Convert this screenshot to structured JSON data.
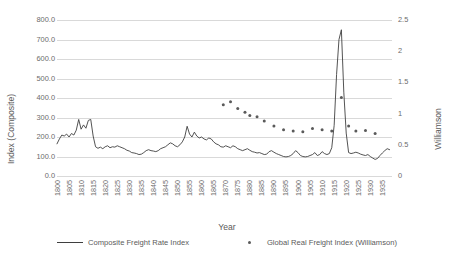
{
  "chart_data": {
    "type": "line",
    "title": "",
    "xlabel": "Year",
    "ylabel": "Index (Composite)",
    "y2label": "Williamson",
    "xlim": [
      1800,
      1939
    ],
    "ylim": [
      0,
      800
    ],
    "y2lim": [
      0,
      2.5
    ],
    "grid": true,
    "legend_position": "bottom",
    "y_ticks": [
      "0.0",
      "100.0",
      "200.0",
      "300.0",
      "400.0",
      "500.0",
      "600.0",
      "700.0",
      "800.0"
    ],
    "y_tick_values": [
      0,
      100,
      200,
      300,
      400,
      500,
      600,
      700,
      800
    ],
    "y2_ticks": [
      "0",
      "0.5",
      "1",
      "1.5",
      "2",
      "2.5"
    ],
    "y2_tick_values": [
      0,
      0.5,
      1,
      1.5,
      2,
      2.5
    ],
    "x_ticks": [
      "1800",
      "1805",
      "1810",
      "1815",
      "1820",
      "1825",
      "1830",
      "1835",
      "1840",
      "1845",
      "1850",
      "1855",
      "1860",
      "1865",
      "1870",
      "1875",
      "1880",
      "1885",
      "1890",
      "1895",
      "1900",
      "1905",
      "1910",
      "1915",
      "1920",
      "1925",
      "1930",
      "1935"
    ],
    "x_tick_values": [
      1800,
      1805,
      1810,
      1815,
      1820,
      1825,
      1830,
      1835,
      1840,
      1845,
      1850,
      1855,
      1860,
      1865,
      1870,
      1875,
      1880,
      1885,
      1890,
      1895,
      1900,
      1905,
      1910,
      1915,
      1920,
      1925,
      1930,
      1935
    ],
    "series": [
      {
        "name": "Composite Freight Rate Index",
        "type": "line",
        "axis": "left",
        "color": "#3f3f3f",
        "x": [
          1800,
          1801,
          1802,
          1803,
          1804,
          1805,
          1806,
          1807,
          1808,
          1809,
          1810,
          1811,
          1812,
          1813,
          1814,
          1815,
          1816,
          1817,
          1818,
          1819,
          1820,
          1821,
          1822,
          1823,
          1824,
          1825,
          1826,
          1827,
          1828,
          1829,
          1830,
          1831,
          1832,
          1833,
          1834,
          1835,
          1836,
          1837,
          1838,
          1839,
          1840,
          1841,
          1842,
          1843,
          1844,
          1845,
          1846,
          1847,
          1848,
          1849,
          1850,
          1851,
          1852,
          1853,
          1854,
          1855,
          1856,
          1857,
          1858,
          1859,
          1860,
          1861,
          1862,
          1863,
          1864,
          1865,
          1866,
          1867,
          1868,
          1869,
          1870,
          1871,
          1872,
          1873,
          1874,
          1875,
          1876,
          1877,
          1878,
          1879,
          1880,
          1881,
          1882,
          1883,
          1884,
          1885,
          1886,
          1887,
          1888,
          1889,
          1890,
          1891,
          1892,
          1893,
          1894,
          1895,
          1896,
          1897,
          1898,
          1899,
          1900,
          1901,
          1902,
          1903,
          1904,
          1905,
          1906,
          1907,
          1908,
          1909,
          1910,
          1911,
          1912,
          1913,
          1914,
          1915,
          1916,
          1917,
          1918,
          1919,
          1920,
          1921,
          1922,
          1923,
          1924,
          1925,
          1926,
          1927,
          1928,
          1929,
          1930,
          1931,
          1932,
          1933,
          1934,
          1935,
          1936,
          1937,
          1938
        ],
        "y": [
          165,
          190,
          210,
          205,
          215,
          200,
          218,
          210,
          235,
          290,
          240,
          262,
          245,
          285,
          290,
          205,
          150,
          142,
          148,
          140,
          150,
          155,
          145,
          150,
          148,
          155,
          150,
          145,
          140,
          132,
          128,
          120,
          118,
          115,
          110,
          112,
          120,
          130,
          135,
          130,
          128,
          125,
          130,
          140,
          145,
          150,
          160,
          170,
          165,
          155,
          150,
          160,
          175,
          200,
          255,
          215,
          200,
          225,
          205,
          195,
          200,
          190,
          185,
          195,
          190,
          175,
          165,
          160,
          150,
          148,
          155,
          150,
          145,
          155,
          150,
          140,
          135,
          130,
          135,
          140,
          132,
          125,
          122,
          118,
          120,
          115,
          110,
          112,
          125,
          130,
          122,
          115,
          110,
          105,
          100,
          98,
          100,
          105,
          115,
          130,
          120,
          105,
          100,
          98,
          100,
          105,
          110,
          120,
          105,
          110,
          125,
          115,
          110,
          115,
          145,
          260,
          520,
          700,
          750,
          430,
          220,
          120,
          115,
          118,
          122,
          118,
          112,
          108,
          105,
          110,
          100,
          92,
          85,
          90,
          105,
          118,
          130,
          140,
          135
        ]
      },
      {
        "name": "Global Real Freight Index (Williamson)",
        "type": "scatter",
        "axis": "right",
        "color": "#5a5a5a",
        "x": [
          1869,
          1872,
          1875,
          1878,
          1880,
          1883,
          1886,
          1890,
          1894,
          1898,
          1902,
          1906,
          1910,
          1914,
          1918,
          1921,
          1924,
          1928,
          1932
        ],
        "y": [
          1.14,
          1.19,
          1.08,
          1.02,
          0.97,
          0.95,
          0.88,
          0.8,
          0.74,
          0.72,
          0.71,
          0.76,
          0.74,
          0.72,
          1.26,
          0.8,
          0.72,
          0.73,
          0.68
        ]
      }
    ],
    "legend": [
      {
        "label": "Composite Freight Rate Index",
        "marker": "line"
      },
      {
        "label": "Global Real Freight Index (Williamson)",
        "marker": "dot"
      }
    ]
  }
}
